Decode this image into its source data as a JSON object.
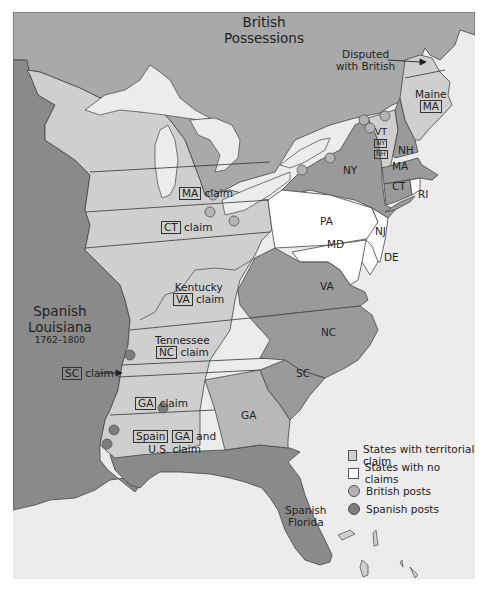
{
  "regions": {
    "british": "British Possessions",
    "british_line1": "British",
    "british_line2": "Possessions",
    "disputed_line1": "Disputed",
    "disputed_line2": "with British",
    "spanish_louisiana_line1": "Spanish",
    "spanish_louisiana_line2": "Louisiana",
    "spanish_louisiana_years": "1762–1800",
    "spanish_florida_line1": "Spanish",
    "spanish_florida_line2": "Florida"
  },
  "states": {
    "maine": "Maine",
    "maine_claim": "MA",
    "vt": "VT",
    "vt_claim_ny": "NY",
    "vt_claim_nh": "NH",
    "nh": "NH",
    "ny": "NY",
    "ma": "MA",
    "ct": "CT",
    "ri": "RI",
    "pa": "PA",
    "nj": "NJ",
    "md": "MD",
    "de": "DE",
    "va": "VA",
    "nc": "NC",
    "sc": "SC",
    "ga": "GA"
  },
  "claims": {
    "ma_box": "MA",
    "ma_text": "claim",
    "ct_box": "CT",
    "ct_text": "claim",
    "kentucky": "Kentucky",
    "va_box": "VA",
    "va_text": "claim",
    "tennessee": "Tennessee",
    "nc_box": "NC",
    "nc_text": "claim",
    "sc_box": "SC",
    "sc_text": "claim",
    "ga_box": "GA",
    "ga_text": "claim",
    "spain_box": "Spain",
    "ga2_box": "GA",
    "and_text": "and",
    "us_claim": "U.S. claim"
  },
  "legend": {
    "items": [
      {
        "label": "States with territorial claim",
        "swatch": "#cfcfcf",
        "shape": "square"
      },
      {
        "label": "States with no claims",
        "swatch": "#ffffff",
        "shape": "square"
      },
      {
        "label": "British posts",
        "swatch": "#b4b4b4",
        "shape": "circle"
      },
      {
        "label": "Spanish posts",
        "swatch": "#7d7d7d",
        "shape": "circle"
      }
    ]
  },
  "colors": {
    "british_territory": "#a9a9a9",
    "spanish_territory": "#8a8a8a",
    "claim_states": "#cfcfcf",
    "no_claim_states": "#ffffff",
    "dark_states": "#9a9a9a",
    "water": "#ececec",
    "lakes": "#ececec",
    "british_post": "#b4b4b4",
    "spanish_post": "#7d7d7d"
  }
}
